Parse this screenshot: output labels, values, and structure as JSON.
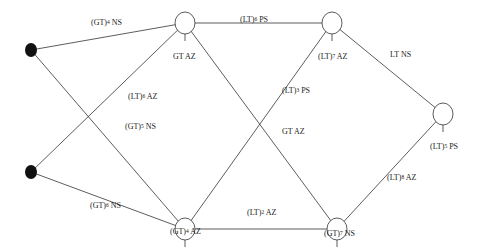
{
  "nodes": [
    {
      "id": "S1",
      "type": "source",
      "x": 24,
      "y": 78,
      "label": ""
    },
    {
      "id": "S2",
      "type": "source",
      "x": 24,
      "y": 172,
      "label": ""
    },
    {
      "id": "A",
      "type": "state",
      "x": 181,
      "y": 22,
      "label": {
        "base": "GT",
        "exp": "",
        "tail": "AZ"
      }
    },
    {
      "id": "B",
      "type": "state",
      "x": 181,
      "y": 228,
      "label": {
        "base": "(GT)",
        "exp": "4",
        "tail": "AZ"
      }
    },
    {
      "id": "C",
      "type": "state",
      "x": 334,
      "y": 22,
      "label": {
        "base": "(LT)",
        "exp": "7",
        "tail": "AZ"
      }
    },
    {
      "id": "D",
      "type": "state",
      "x": 334,
      "y": 228,
      "label": {
        "base": "(GT)",
        "exp": "7",
        "tail": "NS"
      }
    },
    {
      "id": "E",
      "type": "state",
      "x": 459,
      "y": 140,
      "label": {
        "base": "(LT)",
        "exp": "5",
        "tail": "PS"
      }
    }
  ],
  "edges": [
    {
      "from": "S1",
      "to": "A",
      "label": {
        "base": "(GT)",
        "exp": "4",
        "tail": "NS"
      }
    },
    {
      "from": "S1",
      "to": "B",
      "label": {
        "base": "(GT)",
        "exp": "5",
        "tail": "NS"
      }
    },
    {
      "from": "S2",
      "to": "A",
      "label": {
        "base": "(LT)",
        "exp": "6",
        "tail": "AZ"
      }
    },
    {
      "from": "S2",
      "to": "B",
      "label": {
        "base": "(GT)",
        "exp": "6",
        "tail": "NS"
      }
    },
    {
      "from": "A",
      "to": "C",
      "label": {
        "base": "(LT)",
        "exp": "6",
        "tail": "PS"
      }
    },
    {
      "from": "A",
      "to": "D",
      "label": {
        "base": "GT",
        "exp": "",
        "tail": "AZ"
      }
    },
    {
      "from": "B",
      "to": "C",
      "label": {
        "base": "(LT)",
        "exp": "3",
        "tail": "PS"
      }
    },
    {
      "from": "B",
      "to": "D",
      "label": {
        "base": "(LT)",
        "exp": "2",
        "tail": "AZ"
      }
    },
    {
      "from": "C",
      "to": "E",
      "label": {
        "base": "LT",
        "exp": "",
        "tail": "NS"
      }
    },
    {
      "from": "D",
      "to": "E",
      "label": {
        "base": "(LT)",
        "exp": "8",
        "tail": "AZ"
      }
    }
  ],
  "labels": {
    "e1": {
      "base": "(GT)",
      "exp": "4",
      "tail": " NS"
    },
    "e2": {
      "base": "(GT)",
      "exp": "5",
      "tail": " NS"
    },
    "e3": {
      "base": "(LT)",
      "exp": "6",
      "tail": " AZ"
    },
    "e4": {
      "base": "(GT)",
      "exp": "6",
      "tail": " NS"
    },
    "e5": {
      "base": "(LT)",
      "exp": "6",
      "tail": " PS"
    },
    "e6": {
      "base": "GT AZ",
      "exp": "",
      "tail": ""
    },
    "e7": {
      "base": "(LT)",
      "exp": "3",
      "tail": " PS"
    },
    "e8": {
      "base": "(LT)",
      "exp": "2",
      "tail": " AZ"
    },
    "e9": {
      "base": "LT NS",
      "exp": "",
      "tail": ""
    },
    "e10": {
      "base": "(LT)",
      "exp": "8",
      "tail": " AZ"
    },
    "nA": {
      "base": "GT AZ",
      "exp": "",
      "tail": ""
    },
    "nB": {
      "base": "(GT)",
      "exp": "4",
      "tail": " AZ"
    },
    "nC": {
      "base": "(LT)",
      "exp": "7",
      "tail": " AZ"
    },
    "nD": {
      "base": "(GT)",
      "exp": "7",
      "tail": " NS"
    },
    "nE": {
      "base": "(LT)",
      "exp": "5",
      "tail": " PS"
    }
  }
}
